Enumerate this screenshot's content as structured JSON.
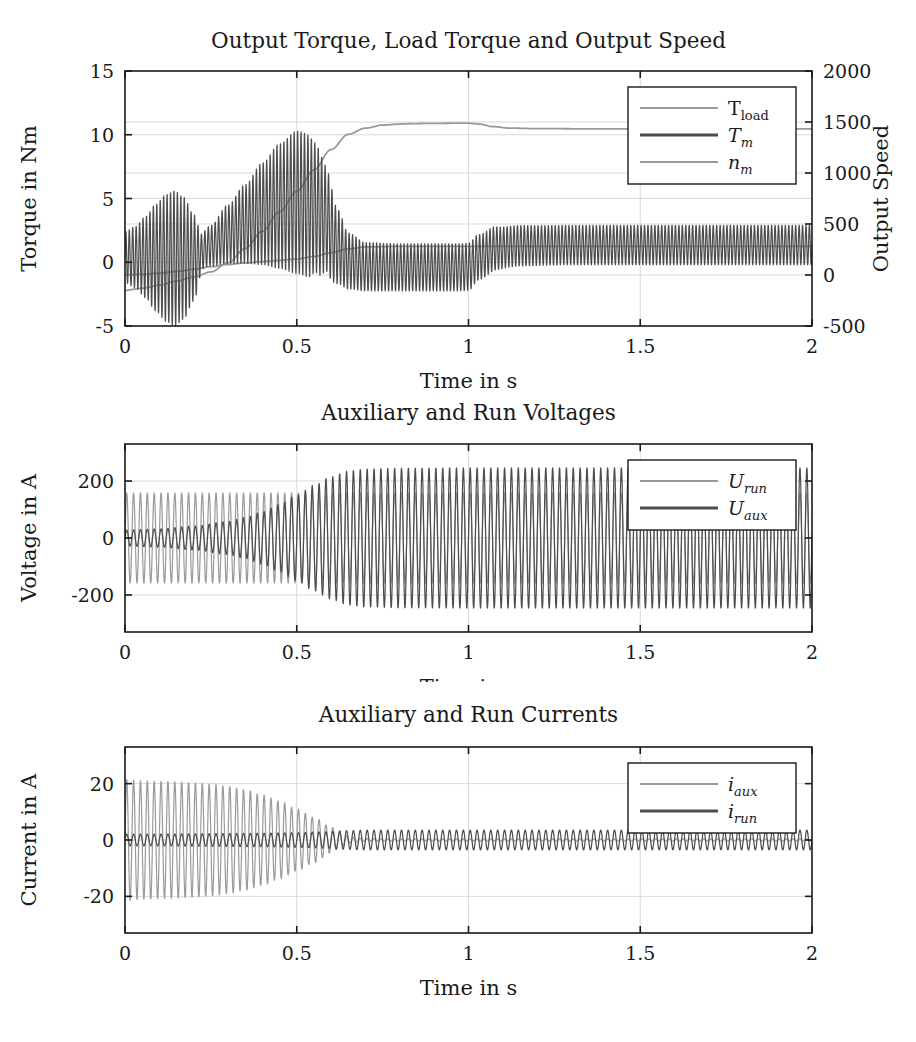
{
  "figure": {
    "background": "#ffffff",
    "axis_color": "#1a1a1a",
    "grid_color": "#d9d9d9",
    "series_light": "#9a9a9a",
    "series_dark": "#4d4d4d"
  },
  "chart_data": [
    {
      "type": "line",
      "id": "torque",
      "title": "Output Torque, Load Torque and Output Speed",
      "xlabel": "Time in s",
      "ylabel": "Torque in Nm",
      "y2label": "Output Speed",
      "xlim": [
        0,
        2
      ],
      "ylim": [
        -5,
        15
      ],
      "y2lim": [
        -500,
        2000
      ],
      "xticks": [
        0,
        0.5,
        1,
        1.5,
        2
      ],
      "xticklabels": [
        "0",
        "0.5",
        "1",
        "1.5",
        "2"
      ],
      "yticks": [
        -5,
        0,
        5,
        10,
        15
      ],
      "yticklabels": [
        "-5",
        "0",
        "5",
        "10",
        "15"
      ],
      "y2ticks": [
        -500,
        0,
        500,
        1000,
        1500,
        2000
      ],
      "y2ticklabels": [
        "-500",
        "0",
        "500",
        "1000",
        "1500",
        "2000"
      ],
      "grid": true,
      "legend_position": "top-right",
      "legend": [
        {
          "label": "T",
          "sub": "load",
          "italic": false,
          "color": "#9a9a9a",
          "width": 1.8
        },
        {
          "label": "T",
          "sub": "m",
          "italic": true,
          "color": "#4d4d4d",
          "width": 3.0
        },
        {
          "label": "n",
          "sub": "m",
          "italic": true,
          "color": "#9a9a9a",
          "width": 1.8
        }
      ],
      "series": [
        {
          "name": "T_load",
          "color": "#9a9a9a",
          "kind": "smooth",
          "points": [
            [
              0,
              -1.0
            ],
            [
              0.05,
              -0.95
            ],
            [
              0.1,
              -0.85
            ],
            [
              0.15,
              -0.72
            ],
            [
              0.2,
              -0.55
            ],
            [
              0.25,
              -0.35
            ],
            [
              0.3,
              -0.18
            ],
            [
              0.35,
              -0.05
            ],
            [
              0.4,
              0.05
            ],
            [
              0.45,
              0.15
            ],
            [
              0.5,
              0.25
            ],
            [
              0.55,
              0.45
            ],
            [
              0.6,
              0.75
            ],
            [
              0.65,
              1.05
            ],
            [
              0.7,
              1.2
            ],
            [
              0.8,
              1.25
            ],
            [
              0.9,
              1.25
            ],
            [
              1.0,
              1.25
            ],
            [
              1.2,
              1.25
            ],
            [
              1.5,
              1.25
            ],
            [
              2.0,
              1.25
            ]
          ]
        },
        {
          "name": "n_m",
          "color": "#9a9a9a",
          "kind": "smooth",
          "axis": "right",
          "points": [
            [
              0,
              -150
            ],
            [
              0.05,
              -130
            ],
            [
              0.1,
              -100
            ],
            [
              0.15,
              -60
            ],
            [
              0.2,
              -20
            ],
            [
              0.25,
              30
            ],
            [
              0.3,
              120
            ],
            [
              0.35,
              260
            ],
            [
              0.4,
              430
            ],
            [
              0.45,
              620
            ],
            [
              0.5,
              820
            ],
            [
              0.55,
              1030
            ],
            [
              0.6,
              1230
            ],
            [
              0.65,
              1380
            ],
            [
              0.7,
              1440
            ],
            [
              0.75,
              1470
            ],
            [
              0.8,
              1480
            ],
            [
              0.85,
              1485
            ],
            [
              0.9,
              1487
            ],
            [
              0.95,
              1488
            ],
            [
              1.0,
              1488
            ],
            [
              1.03,
              1480
            ],
            [
              1.07,
              1455
            ],
            [
              1.12,
              1440
            ],
            [
              1.2,
              1435
            ],
            [
              1.35,
              1433
            ],
            [
              1.5,
              1432
            ],
            [
              1.75,
              1432
            ],
            [
              2.0,
              1432
            ]
          ]
        },
        {
          "name": "T_m",
          "color": "#4d4d4d",
          "kind": "oscillation",
          "freq": 100,
          "center": [
            [
              0,
              0.4
            ],
            [
              0.05,
              0.4
            ],
            [
              0.1,
              0.35
            ],
            [
              0.15,
              0.3
            ],
            [
              0.2,
              0.35
            ],
            [
              0.25,
              1.3
            ],
            [
              0.3,
              2.2
            ],
            [
              0.35,
              3.0
            ],
            [
              0.4,
              3.8
            ],
            [
              0.45,
              4.4
            ],
            [
              0.5,
              4.7
            ],
            [
              0.55,
              4.3
            ],
            [
              0.58,
              3.5
            ],
            [
              0.62,
              1.2
            ],
            [
              0.65,
              0.1
            ],
            [
              0.7,
              -0.35
            ],
            [
              0.8,
              -0.4
            ],
            [
              0.9,
              -0.4
            ],
            [
              0.98,
              -0.4
            ],
            [
              1.0,
              -0.35
            ],
            [
              1.03,
              0.4
            ],
            [
              1.08,
              1.1
            ],
            [
              1.15,
              1.3
            ],
            [
              1.3,
              1.35
            ],
            [
              1.6,
              1.35
            ],
            [
              2.0,
              1.35
            ]
          ],
          "amplitude": [
            [
              0,
              2.0
            ],
            [
              0.03,
              2.4
            ],
            [
              0.06,
              3.2
            ],
            [
              0.09,
              4.2
            ],
            [
              0.12,
              5.0
            ],
            [
              0.145,
              5.3
            ],
            [
              0.17,
              4.8
            ],
            [
              0.2,
              3.4
            ],
            [
              0.225,
              1.4
            ],
            [
              0.25,
              1.6
            ],
            [
              0.3,
              2.3
            ],
            [
              0.35,
              3.1
            ],
            [
              0.4,
              4.0
            ],
            [
              0.45,
              4.9
            ],
            [
              0.5,
              5.6
            ],
            [
              0.53,
              5.6
            ],
            [
              0.56,
              5.0
            ],
            [
              0.59,
              4.0
            ],
            [
              0.62,
              2.9
            ],
            [
              0.65,
              2.2
            ],
            [
              0.7,
              1.9
            ],
            [
              0.8,
              1.85
            ],
            [
              0.9,
              1.85
            ],
            [
              1.0,
              1.85
            ],
            [
              1.05,
              1.75
            ],
            [
              1.12,
              1.6
            ],
            [
              1.25,
              1.55
            ],
            [
              1.5,
              1.55
            ],
            [
              2.0,
              1.55
            ]
          ]
        }
      ]
    },
    {
      "type": "line",
      "id": "voltage",
      "title": "Auxiliary and Run Voltages",
      "xlabel": "Time in s",
      "ylabel": "Voltage in A",
      "xlim": [
        0,
        2
      ],
      "ylim": [
        -330,
        330
      ],
      "xticks": [
        0,
        0.5,
        1,
        1.5,
        2
      ],
      "xticklabels": [
        "0",
        "0.5",
        "1",
        "1.5",
        "2"
      ],
      "yticks": [
        -200,
        0,
        200
      ],
      "yticklabels": [
        "-200",
        "0",
        "200"
      ],
      "grid": true,
      "legend_position": "top-right",
      "legend": [
        {
          "label": "U",
          "sub": "run",
          "italic": true,
          "color": "#9a9a9a",
          "width": 1.8
        },
        {
          "label": "U",
          "sub": "aux",
          "italic": true,
          "color": "#4d4d4d",
          "width": 3.0
        }
      ],
      "series": [
        {
          "name": "U_run",
          "color": "#9a9a9a",
          "kind": "oscillation",
          "freq": 50,
          "center": [
            [
              0,
              0
            ],
            [
              2,
              0
            ]
          ],
          "amplitude": [
            [
              0,
              158
            ],
            [
              0.5,
              158
            ],
            [
              1.0,
              158
            ],
            [
              1.5,
              158
            ],
            [
              2.0,
              158
            ]
          ]
        },
        {
          "name": "U_aux",
          "color": "#4d4d4d",
          "kind": "oscillation",
          "freq": 50,
          "center": [
            [
              0,
              0
            ],
            [
              2,
              0
            ]
          ],
          "amplitude": [
            [
              0,
              28
            ],
            [
              0.1,
              32
            ],
            [
              0.2,
              42
            ],
            [
              0.3,
              58
            ],
            [
              0.35,
              72
            ],
            [
              0.4,
              92
            ],
            [
              0.45,
              118
            ],
            [
              0.5,
              150
            ],
            [
              0.55,
              185
            ],
            [
              0.6,
              215
            ],
            [
              0.65,
              235
            ],
            [
              0.7,
              242
            ],
            [
              0.8,
              245
            ],
            [
              1.0,
              246
            ],
            [
              1.2,
              246
            ],
            [
              1.5,
              246
            ],
            [
              1.75,
              246
            ],
            [
              2.0,
              246
            ]
          ]
        }
      ]
    },
    {
      "type": "line",
      "id": "current",
      "title": "Auxiliary and Run Currents",
      "xlabel": "Time in s",
      "ylabel": "Current in A",
      "xlim": [
        0,
        2
      ],
      "ylim": [
        -33,
        33
      ],
      "xticks": [
        0,
        0.5,
        1,
        1.5,
        2
      ],
      "xticklabels": [
        "0",
        "0.5",
        "1",
        "1.5",
        "2"
      ],
      "yticks": [
        -20,
        0,
        20
      ],
      "yticklabels": [
        "-20",
        "0",
        "20"
      ],
      "grid": true,
      "legend_position": "top-right",
      "legend": [
        {
          "label": "i",
          "sub": "aux",
          "italic": true,
          "color": "#9a9a9a",
          "width": 1.8
        },
        {
          "label": "i",
          "sub": "run",
          "italic": true,
          "color": "#4d4d4d",
          "width": 3.0
        }
      ],
      "series": [
        {
          "name": "i_aux",
          "color": "#9a9a9a",
          "kind": "oscillation",
          "freq": 50,
          "center": [
            [
              0,
              0
            ],
            [
              2,
              0
            ]
          ],
          "amplitude": [
            [
              0,
              21.5
            ],
            [
              0.05,
              21.0
            ],
            [
              0.1,
              20.8
            ],
            [
              0.15,
              20.6
            ],
            [
              0.2,
              20.3
            ],
            [
              0.25,
              19.8
            ],
            [
              0.3,
              19.0
            ],
            [
              0.35,
              17.8
            ],
            [
              0.4,
              16.0
            ],
            [
              0.45,
              13.8
            ],
            [
              0.5,
              11.0
            ],
            [
              0.55,
              8.0
            ],
            [
              0.6,
              4.6
            ],
            [
              0.63,
              2.2
            ],
            [
              0.66,
              0.9
            ],
            [
              0.7,
              0.5
            ],
            [
              0.8,
              0.4
            ],
            [
              1.0,
              0.4
            ],
            [
              1.5,
              0.4
            ],
            [
              2.0,
              0.4
            ]
          ]
        },
        {
          "name": "i_run",
          "color": "#4d4d4d",
          "kind": "oscillation",
          "freq": 50,
          "center": [
            [
              0,
              0
            ],
            [
              2,
              0
            ]
          ],
          "amplitude": [
            [
              0,
              2.1
            ],
            [
              0.1,
              2.1
            ],
            [
              0.2,
              2.2
            ],
            [
              0.3,
              2.3
            ],
            [
              0.4,
              2.4
            ],
            [
              0.5,
              2.6
            ],
            [
              0.58,
              2.9
            ],
            [
              0.64,
              3.3
            ],
            [
              0.7,
              3.5
            ],
            [
              0.8,
              3.5
            ],
            [
              1.0,
              3.5
            ],
            [
              1.3,
              3.5
            ],
            [
              1.6,
              3.5
            ],
            [
              2.0,
              3.5
            ]
          ]
        }
      ]
    }
  ]
}
